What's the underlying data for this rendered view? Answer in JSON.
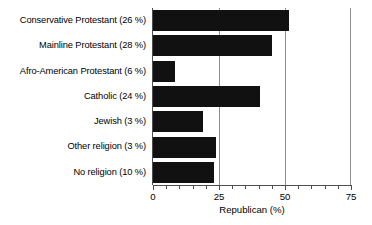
{
  "chart_data": {
    "type": "bar",
    "orientation": "horizontal",
    "title": "",
    "xlabel": "Republican (%)",
    "ylabel": "",
    "xlim": [
      0,
      75
    ],
    "xticks": [
      0,
      25,
      50,
      75
    ],
    "xtick_labels": [
      "0",
      "25",
      "50",
      "75"
    ],
    "minor_tick_step": 5,
    "grid": "vertical gridlines at 25 and 50",
    "legend": "none",
    "bar_color": "#111111",
    "categories": [
      "Conservative Protestant (26 %)",
      "Mainline Protestant (28 %)",
      "Afro-American Protestant (6 %)",
      "Catholic (24 %)",
      "Jewish (3 %)",
      "Other religion (3 %)",
      "No religion (10 %)"
    ],
    "values": [
      51.5,
      45,
      8.5,
      40.5,
      19,
      24,
      23
    ],
    "category_shares": [
      26,
      28,
      6,
      24,
      3,
      3,
      10
    ]
  },
  "caption": {
    "text": "partially visible cut-off text line"
  }
}
